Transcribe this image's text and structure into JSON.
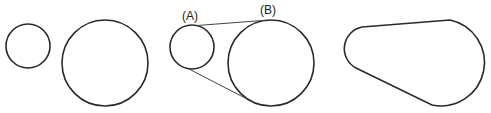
{
  "diagram": {
    "panels": [
      {
        "id": "separate-pulleys",
        "shapes": [
          "small-circle",
          "large-circle"
        ]
      },
      {
        "id": "tangent-construction",
        "labels": {
          "small": "(A)",
          "large": "(B)"
        }
      },
      {
        "id": "belt-outline"
      }
    ],
    "colors": {
      "stroke": "#2a2a2a",
      "background": "#ffffff"
    }
  }
}
